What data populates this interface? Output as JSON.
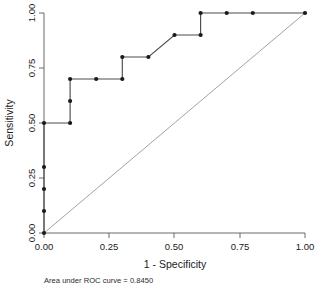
{
  "chart_data": {
    "type": "line",
    "title": "",
    "xlabel": "1 - Specificity",
    "ylabel": "Sensitivity",
    "xlim": [
      0,
      1
    ],
    "ylim": [
      0,
      1
    ],
    "grid": false,
    "legend": "none",
    "xticks": [
      "0.00",
      "0.25",
      "0.50",
      "0.75",
      "1.00"
    ],
    "xtick_values": [
      0,
      0.25,
      0.5,
      0.75,
      1
    ],
    "yticks": [
      "0.00",
      "0.25",
      "0.50",
      "0.75",
      "1.00"
    ],
    "ytick_values": [
      0,
      0.25,
      0.5,
      0.75,
      1
    ],
    "series": [
      {
        "name": "ROC curve",
        "marker": "filled-circle",
        "x": [
          0,
          0,
          0,
          0,
          0,
          0.1,
          0.1,
          0.1,
          0.2,
          0.3,
          0.3,
          0.4,
          0.5,
          0.6,
          0.6,
          0.7,
          0.8,
          1
        ],
        "y": [
          0,
          0.1,
          0.2,
          0.3,
          0.5,
          0.5,
          0.6,
          0.7,
          0.7,
          0.7,
          0.8,
          0.8,
          0.9,
          0.9,
          1,
          1,
          1,
          1
        ]
      },
      {
        "name": "Reference line",
        "marker": "none",
        "x": [
          0,
          1
        ],
        "y": [
          0,
          1
        ]
      }
    ],
    "annotations": [
      {
        "name": "auc-caption",
        "text": "Area under ROC curve = 0.8450",
        "value": 0.845
      }
    ]
  },
  "figure": {
    "caption": "Area under ROC curve = 0.8450",
    "x_axis_title": "1 - Specificity",
    "y_axis_title": "Sensitivity"
  },
  "colors": {
    "roc_line": "#4d4d4d",
    "reference_line": "#8a8a8a",
    "marker": "#1a1a1a",
    "axis": "#5a5a5a",
    "background": "#ffffff"
  }
}
